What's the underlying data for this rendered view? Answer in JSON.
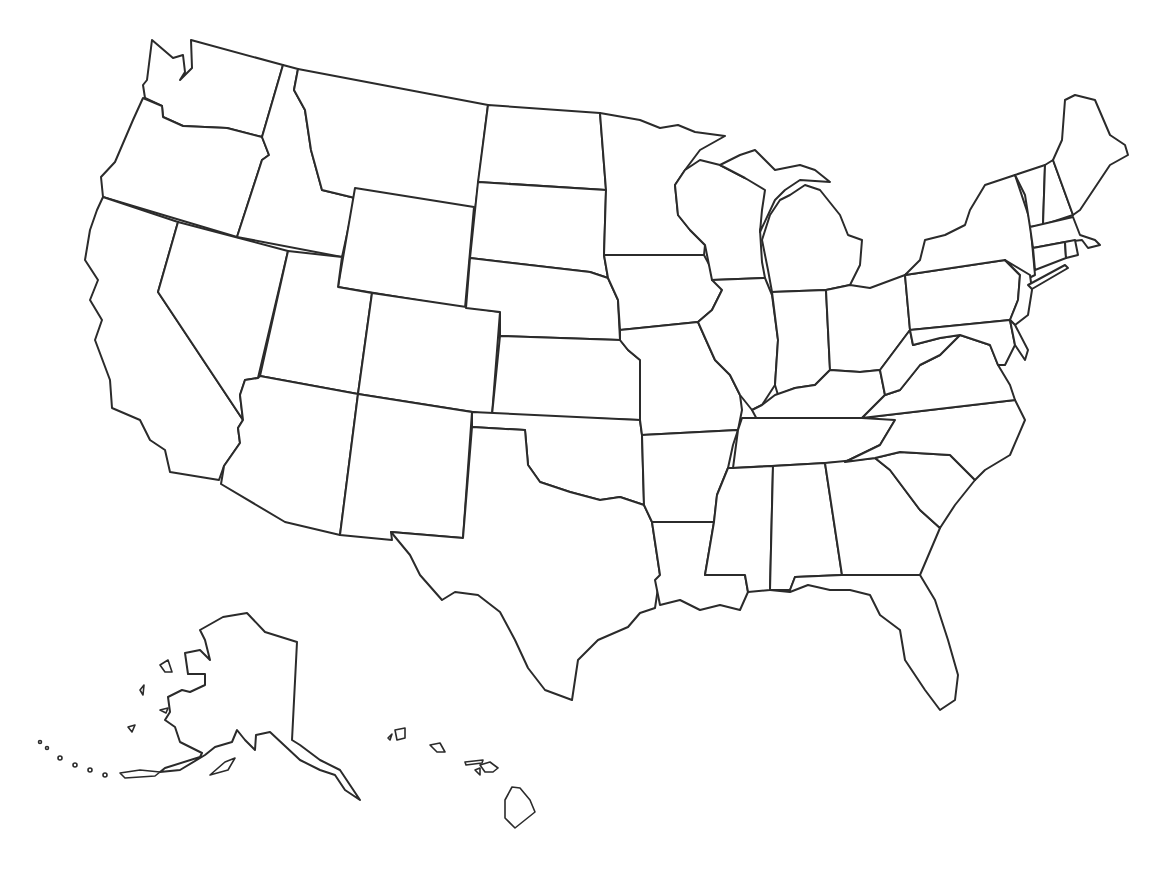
{
  "map": {
    "title": "",
    "type": "blank outline map",
    "region": "United States",
    "background_color": "#ffffff",
    "stroke_color": "#2b2b2b",
    "labels_visible": false,
    "insets": [
      "Alaska",
      "Hawaii"
    ],
    "states": [
      "WA",
      "OR",
      "CA",
      "ID",
      "NV",
      "MT",
      "WY",
      "UT",
      "AZ",
      "CO",
      "NM",
      "ND",
      "SD",
      "NE",
      "KS",
      "OK",
      "TX",
      "MN",
      "IA",
      "MO",
      "AR",
      "LA",
      "WI",
      "IL",
      "MI",
      "IN",
      "OH",
      "KY",
      "TN",
      "MS",
      "AL",
      "GA",
      "FL",
      "SC",
      "NC",
      "VA",
      "WV",
      "PA",
      "NY",
      "MD",
      "DE",
      "NJ",
      "CT",
      "RI",
      "MA",
      "VT",
      "NH",
      "ME",
      "AK",
      "HI"
    ]
  }
}
